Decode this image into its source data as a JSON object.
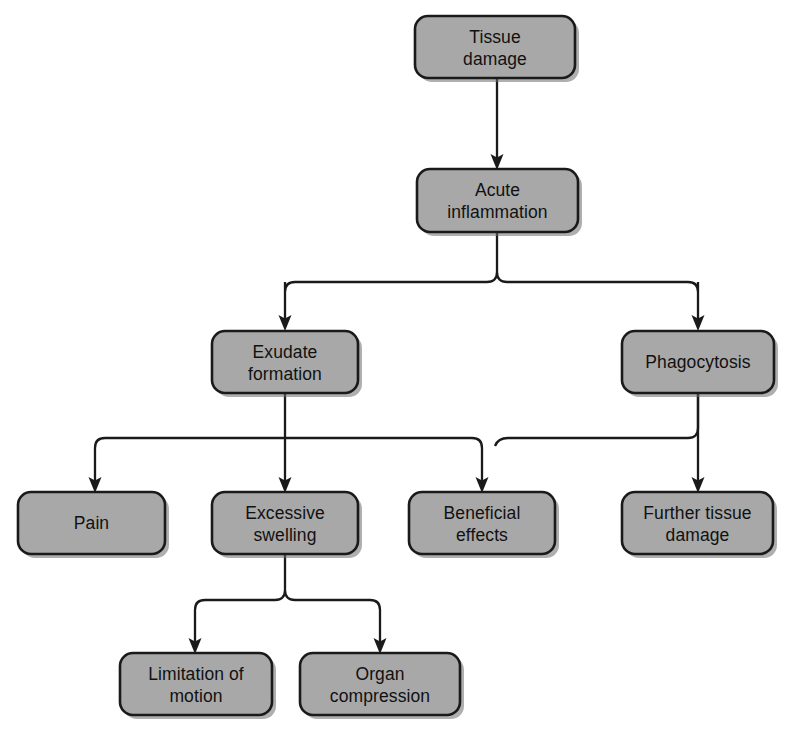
{
  "diagram": {
    "background_color": "#ffffff",
    "node_fill_color": "#a8a8a8",
    "node_border_color": "#1a1a1a",
    "text_color": "#111111",
    "connector_color": "#1a1a1a",
    "nodes": [
      {
        "id": "tissue-damage",
        "lines": [
          "Tissue",
          "damage"
        ],
        "x": 415,
        "y": 16,
        "w": 160,
        "h": 62
      },
      {
        "id": "acute-inflammation",
        "lines": [
          "Acute",
          "inflammation"
        ],
        "x": 417,
        "y": 169,
        "w": 161,
        "h": 63
      },
      {
        "id": "exudate-formation",
        "lines": [
          "Exudate",
          "formation"
        ],
        "x": 212,
        "y": 331,
        "w": 146,
        "h": 62
      },
      {
        "id": "phagocytosis",
        "lines": [
          "Phagocytosis"
        ],
        "x": 622,
        "y": 331,
        "w": 152,
        "h": 62
      },
      {
        "id": "pain",
        "lines": [
          "Pain"
        ],
        "x": 18,
        "y": 492,
        "w": 147,
        "h": 62
      },
      {
        "id": "excessive-swelling",
        "lines": [
          "Excessive",
          "swelling"
        ],
        "x": 212,
        "y": 492,
        "w": 146,
        "h": 62
      },
      {
        "id": "beneficial-effects",
        "lines": [
          "Beneficial",
          "effects"
        ],
        "x": 409,
        "y": 492,
        "w": 146,
        "h": 62
      },
      {
        "id": "further-tissue-damage",
        "lines": [
          "Further tissue",
          "damage"
        ],
        "x": 622,
        "y": 492,
        "w": 151,
        "h": 62
      },
      {
        "id": "limitation-of-motion",
        "lines": [
          "Limitation of",
          "motion"
        ],
        "x": 120,
        "y": 653,
        "w": 152,
        "h": 62
      },
      {
        "id": "organ-compression",
        "lines": [
          "Organ",
          "compression"
        ],
        "x": 300,
        "y": 653,
        "w": 160,
        "h": 62
      }
    ],
    "edges": [
      {
        "id": "tissue-damage-to-acute-inflammation",
        "from": "tissue-damage",
        "to": "acute-inflammation"
      },
      {
        "id": "acute-inflammation-to-exudate-formation",
        "from": "acute-inflammation",
        "to": "exudate-formation"
      },
      {
        "id": "acute-inflammation-to-phagocytosis",
        "from": "acute-inflammation",
        "to": "phagocytosis"
      },
      {
        "id": "exudate-formation-to-pain",
        "from": "exudate-formation",
        "to": "pain"
      },
      {
        "id": "exudate-formation-to-excessive-swelling",
        "from": "exudate-formation",
        "to": "excessive-swelling"
      },
      {
        "id": "exudate-formation-to-beneficial-effects",
        "from": "exudate-formation",
        "to": "beneficial-effects"
      },
      {
        "id": "phagocytosis-to-beneficial-effects",
        "from": "phagocytosis",
        "to": "beneficial-effects"
      },
      {
        "id": "phagocytosis-to-further-tissue-damage",
        "from": "phagocytosis",
        "to": "further-tissue-damage"
      },
      {
        "id": "excessive-swelling-to-limitation-of-motion",
        "from": "excessive-swelling",
        "to": "limitation-of-motion"
      },
      {
        "id": "excessive-swelling-to-organ-compression",
        "from": "excessive-swelling",
        "to": "organ-compression"
      }
    ]
  }
}
